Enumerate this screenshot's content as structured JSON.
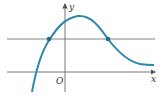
{
  "figure": {
    "type": "function-graph",
    "axes": {
      "x_label": "x",
      "y_label": "y",
      "origin_label": "O"
    },
    "horizontal_line": {
      "description": "line y = k intersecting curve at two points"
    },
    "curve": {
      "description": "rises from lower left, peaks just right of y-axis, then decays toward a horizontal asymptote"
    },
    "intersection_points": 2,
    "colors": {
      "curve": "#2e86ab",
      "axes": "#555555",
      "points": "#1f6f8b"
    }
  }
}
